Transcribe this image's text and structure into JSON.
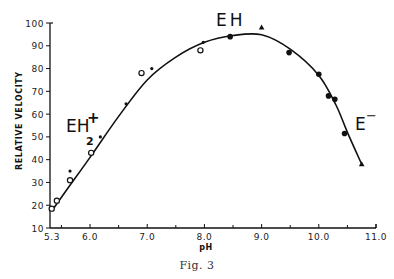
{
  "chart_data": {
    "type": "scatter",
    "title": "",
    "caption": "Fig. 3",
    "xlabel": "pH",
    "ylabel": "RELATIVE VELOCITY",
    "xlim": [
      5.3,
      11.0
    ],
    "ylim": [
      10,
      100
    ],
    "grid": false,
    "legend": null,
    "x_ticks": [
      {
        "value": 5.3,
        "label": "5.3"
      },
      {
        "value": 6.0,
        "label": "6.0"
      },
      {
        "value": 7.0,
        "label": "7.0"
      },
      {
        "value": 8.0,
        "label": "8.0"
      },
      {
        "value": 9.0,
        "label": "9.0"
      },
      {
        "value": 10.0,
        "label": "10.0"
      },
      {
        "value": 11.0,
        "label": "11.0"
      }
    ],
    "x_minor_ticks": [
      5.5,
      6.5,
      7.5,
      8.5,
      9.5,
      10.5
    ],
    "y_ticks": [
      {
        "value": 10,
        "label": "10"
      },
      {
        "value": 20,
        "label": "20"
      },
      {
        "value": 30,
        "label": "30"
      },
      {
        "value": 40,
        "label": "40"
      },
      {
        "value": 50,
        "label": "50"
      },
      {
        "value": 60,
        "label": "60"
      },
      {
        "value": 70,
        "label": "70"
      },
      {
        "value": 80,
        "label": "80"
      },
      {
        "value": 90,
        "label": "90"
      },
      {
        "value": 100,
        "label": "100"
      }
    ],
    "annotations": [
      {
        "text": "EH",
        "sub": "2",
        "sup": "+",
        "x": 5.65,
        "y": 55
      },
      {
        "text": "EH",
        "x": 8.5,
        "y": 101
      },
      {
        "text": "E",
        "sup": "−",
        "x": 10.6,
        "y": 58
      }
    ],
    "series": [
      {
        "name": "open circles",
        "marker": "open-circle",
        "points": [
          [
            5.33,
            18.5
          ],
          [
            5.42,
            22
          ],
          [
            5.65,
            31
          ],
          [
            6.02,
            43
          ],
          [
            6.9,
            78
          ],
          [
            7.93,
            88
          ]
        ]
      },
      {
        "name": "small dots",
        "marker": "dot",
        "points": [
          [
            5.65,
            35
          ],
          [
            6.18,
            50
          ],
          [
            6.63,
            64.5
          ],
          [
            7.08,
            80
          ],
          [
            7.98,
            91.5
          ]
        ]
      },
      {
        "name": "filled circles",
        "marker": "filled-circle",
        "points": [
          [
            8.45,
            94
          ],
          [
            9.48,
            87
          ],
          [
            10.0,
            77.5
          ],
          [
            10.17,
            68
          ],
          [
            10.28,
            66.5
          ],
          [
            10.45,
            51.5
          ]
        ]
      },
      {
        "name": "triangles",
        "marker": "triangle",
        "points": [
          [
            9.0,
            98
          ],
          [
            10.75,
            38
          ]
        ]
      }
    ],
    "fit_curve": {
      "name": "fitted curve",
      "points": [
        [
          5.33,
          17.5
        ],
        [
          5.6,
          27
        ],
        [
          6.0,
          41
        ],
        [
          6.5,
          59
        ],
        [
          7.0,
          75
        ],
        [
          7.5,
          85
        ],
        [
          8.0,
          91.5
        ],
        [
          8.5,
          94.5
        ],
        [
          9.0,
          94.8
        ],
        [
          9.5,
          88.5
        ],
        [
          10.0,
          77
        ],
        [
          10.3,
          64
        ],
        [
          10.5,
          52
        ],
        [
          10.75,
          38
        ]
      ]
    }
  },
  "figure": {
    "caption": "Fig. 3",
    "xlabel": "pH",
    "ylabel": "RELATIVE VELOCITY",
    "labels": {
      "eh2": "EH",
      "eh2_sub": "2",
      "eh2_sup": "+",
      "eh": "EH",
      "e": "E",
      "e_sup": "−"
    }
  }
}
